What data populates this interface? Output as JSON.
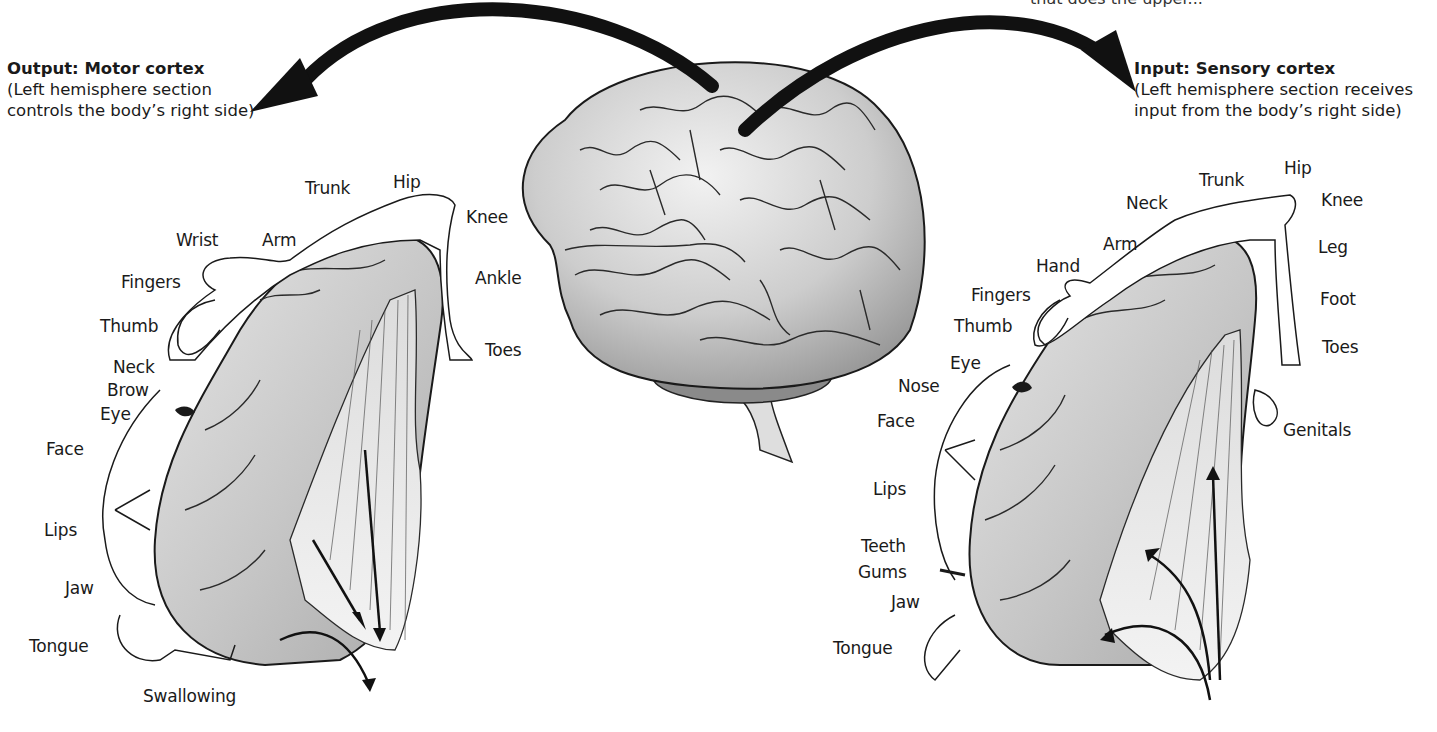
{
  "top_cut_text": "that does the upper...",
  "motor": {
    "title": "Output: Motor cortex",
    "subtitle_line1": "(Left hemisphere section",
    "subtitle_line2": "controls the body’s right side)",
    "labels": [
      {
        "text": "Trunk",
        "x": 305,
        "y": 178
      },
      {
        "text": "Hip",
        "x": 393,
        "y": 172
      },
      {
        "text": "Knee",
        "x": 466,
        "y": 207
      },
      {
        "text": "Wrist",
        "x": 176,
        "y": 230
      },
      {
        "text": "Arm",
        "x": 262,
        "y": 230
      },
      {
        "text": "Fingers",
        "x": 121,
        "y": 272
      },
      {
        "text": "Ankle",
        "x": 475,
        "y": 268
      },
      {
        "text": "Thumb",
        "x": 100,
        "y": 316
      },
      {
        "text": "Toes",
        "x": 485,
        "y": 340
      },
      {
        "text": "Neck",
        "x": 113,
        "y": 357
      },
      {
        "text": "Brow",
        "x": 107,
        "y": 380
      },
      {
        "text": "Eye",
        "x": 100,
        "y": 404
      },
      {
        "text": "Face",
        "x": 46,
        "y": 439
      },
      {
        "text": "Lips",
        "x": 44,
        "y": 520
      },
      {
        "text": "Jaw",
        "x": 65,
        "y": 578
      },
      {
        "text": "Tongue",
        "x": 29,
        "y": 636
      },
      {
        "text": "Swallowing",
        "x": 143,
        "y": 686
      }
    ]
  },
  "sensory": {
    "title": "Input: Sensory cortex",
    "subtitle_line1": "(Left hemisphere section receives",
    "subtitle_line2": "input from the body’s right side)",
    "labels": [
      {
        "text": "Hip",
        "x": 1284,
        "y": 158
      },
      {
        "text": "Trunk",
        "x": 1199,
        "y": 170
      },
      {
        "text": "Neck",
        "x": 1126,
        "y": 193
      },
      {
        "text": "Knee",
        "x": 1321,
        "y": 190
      },
      {
        "text": "Arm",
        "x": 1103,
        "y": 234
      },
      {
        "text": "Leg",
        "x": 1318,
        "y": 237
      },
      {
        "text": "Hand",
        "x": 1036,
        "y": 256
      },
      {
        "text": "Fingers",
        "x": 971,
        "y": 285
      },
      {
        "text": "Foot",
        "x": 1320,
        "y": 289
      },
      {
        "text": "Thumb",
        "x": 954,
        "y": 316
      },
      {
        "text": "Eye",
        "x": 950,
        "y": 353
      },
      {
        "text": "Toes",
        "x": 1322,
        "y": 337
      },
      {
        "text": "Nose",
        "x": 898,
        "y": 376
      },
      {
        "text": "Face",
        "x": 877,
        "y": 411
      },
      {
        "text": "Genitals",
        "x": 1283,
        "y": 420
      },
      {
        "text": "Lips",
        "x": 873,
        "y": 479
      },
      {
        "text": "Teeth",
        "x": 861,
        "y": 536
      },
      {
        "text": "Gums",
        "x": 858,
        "y": 562
      },
      {
        "text": "Jaw",
        "x": 891,
        "y": 592
      },
      {
        "text": "Tongue",
        "x": 833,
        "y": 638
      }
    ]
  },
  "colors": {
    "ink": "#1a1a1a",
    "cortex_fill": "#c9c9c9",
    "cortex_light": "#e4e4e4",
    "brain_fill": "#cfcfcf",
    "background": "#ffffff"
  }
}
